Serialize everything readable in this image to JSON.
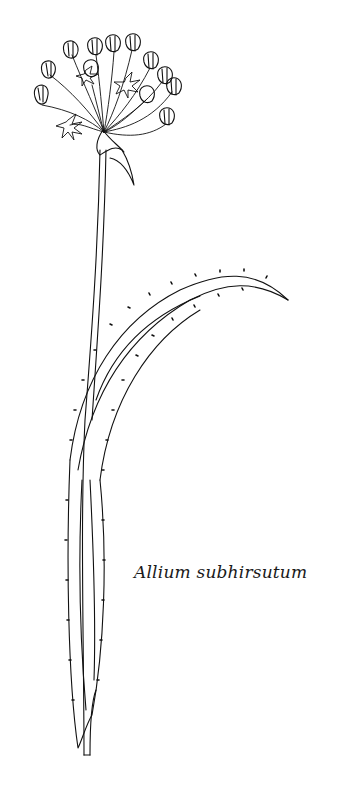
{
  "illustration": {
    "subject": "botanical line drawing of flowering onion plant",
    "stroke_color": "#111111",
    "background": "#ffffff"
  },
  "caption": {
    "text": "Allium subhirsutum"
  }
}
